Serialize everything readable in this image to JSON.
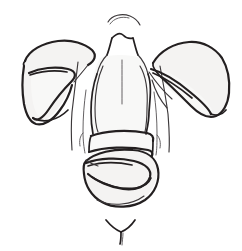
{
  "canvas": {
    "width": 242,
    "height": 251,
    "background": "#ffffff",
    "title": "Hand-drawn anatomical torso sketch"
  },
  "style": {
    "ink_color": "#231f20",
    "ink_secondary": "#3c383a",
    "ink_faint": "#5d5a5c",
    "wash_fill": "#f4f3f2",
    "wash_soft_fill": "#f8f8f7"
  },
  "drawing": {
    "medium": "pen-line-sketch",
    "subject": "frontal torso with draped lobed forms at both shoulders and across the abdomen",
    "parts": [
      {
        "id": "head-crown",
        "label": "head crown arc",
        "region": "top-center"
      },
      {
        "id": "neck",
        "label": "neck and trapezius",
        "region": "upper-center"
      },
      {
        "id": "torso",
        "label": "torso / ribcage outline",
        "region": "center"
      },
      {
        "id": "chest-contour",
        "label": "inner chest contour",
        "region": "center"
      },
      {
        "id": "left-arm",
        "label": "left arm contour",
        "region": "center-left"
      },
      {
        "id": "right-arm",
        "label": "right arm contour",
        "region": "center-right"
      },
      {
        "id": "left-lobe",
        "label": "left draped lobe form",
        "region": "left"
      },
      {
        "id": "left-lobe-fold",
        "label": "left lobe inner fold",
        "region": "left"
      },
      {
        "id": "right-lobe",
        "label": "right draped lobe form",
        "region": "right"
      },
      {
        "id": "right-lobe-fold",
        "label": "right lobe inner fold",
        "region": "right"
      },
      {
        "id": "abdomen-band",
        "label": "upper abdominal band",
        "region": "lower-center"
      },
      {
        "id": "abdomen-lobe",
        "label": "lower abdominal lobe",
        "region": "lower-center"
      },
      {
        "id": "abdomen-fold",
        "label": "abdominal inner fold",
        "region": "lower-center"
      },
      {
        "id": "pubic-mark",
        "label": "Y-shaped mark",
        "region": "bottom-center"
      }
    ]
  }
}
